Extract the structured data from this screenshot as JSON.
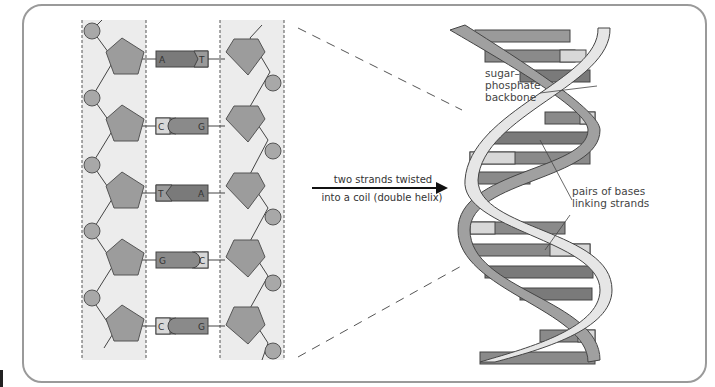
{
  "diagram": {
    "left_panel": {
      "description": "Flat DNA ladder with sugar-phosphate backbones and base pairs",
      "base_pairs": [
        {
          "left": "A",
          "right": "T"
        },
        {
          "left": "C",
          "right": "G"
        },
        {
          "left": "T",
          "right": "A"
        },
        {
          "left": "G",
          "right": "C"
        },
        {
          "left": "C",
          "right": "G"
        }
      ]
    },
    "arrow": {
      "label_top": "two strands twisted",
      "label_bottom": "into a coil (double helix)"
    },
    "right_panel": {
      "labels": {
        "backbone": [
          "sugar–",
          "phosphate",
          "backbone"
        ],
        "bases": [
          "pairs of bases",
          "linking strands"
        ]
      }
    },
    "colors": {
      "pentagon": "#9c9c9c",
      "phosphate": "#a8a8a8",
      "base_dark": "#7a7a7a",
      "base_light": "#d8d8d8",
      "strip_bg": "#ececec",
      "ribbon_light": "#e6e6e6",
      "ribbon_dark": "#a0a0a0",
      "frame": "#9a9a9a"
    }
  }
}
